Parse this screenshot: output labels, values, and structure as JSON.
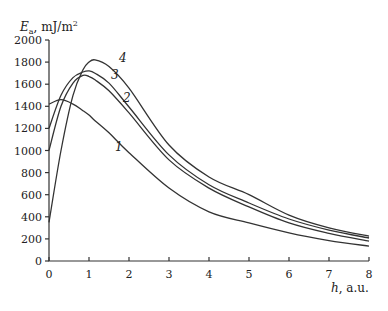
{
  "chart_data": {
    "type": "line",
    "title": "",
    "ylabel": "E_a, mJ/m²",
    "ylabel_main": "E",
    "ylabel_sub": "a",
    "ylabel_unit": ", mJ/m",
    "ylabel_sup": "2",
    "xlabel": "h, a.u.",
    "xlabel_var": "h",
    "xlabel_unit": ", a.u.",
    "xlim": [
      0,
      8
    ],
    "ylim": [
      0,
      2000
    ],
    "x_ticks": [
      "0",
      "1",
      "2",
      "3",
      "4",
      "5",
      "6",
      "7",
      "8"
    ],
    "y_ticks": [
      "0",
      "200",
      "400",
      "600",
      "800",
      "1000",
      "1200",
      "1400",
      "1600",
      "1800",
      "2000"
    ],
    "grid": false,
    "legend": "inline curve labels",
    "x": [
      0,
      0.3,
      0.6,
      0.85,
      1.0,
      1.15,
      1.5,
      2,
      3,
      4,
      5,
      6,
      7,
      8
    ],
    "series": [
      {
        "name": "1",
        "values": [
          1420,
          1460,
          1420,
          1360,
          1320,
          1270,
          1160,
          980,
          660,
          445,
          345,
          255,
          185,
          135
        ]
      },
      {
        "name": "2",
        "values": [
          1000,
          1400,
          1610,
          1680,
          1670,
          1640,
          1540,
          1340,
          915,
          660,
          490,
          345,
          250,
          180
        ]
      },
      {
        "name": "3",
        "values": [
          1200,
          1500,
          1660,
          1710,
          1720,
          1700,
          1610,
          1394,
          960,
          690,
          525,
          380,
          280,
          208
        ]
      },
      {
        "name": "4",
        "values": [
          350,
          1000,
          1500,
          1730,
          1800,
          1820,
          1760,
          1565,
          1050,
          760,
          600,
          415,
          300,
          225
        ]
      }
    ],
    "label_positions": [
      {
        "name": "1",
        "h": 1.65,
        "value": 1000
      },
      {
        "name": "2",
        "h": 1.85,
        "value": 1440
      },
      {
        "name": "3",
        "h": 1.55,
        "value": 1650
      },
      {
        "name": "4",
        "h": 1.75,
        "value": 1800
      }
    ]
  }
}
